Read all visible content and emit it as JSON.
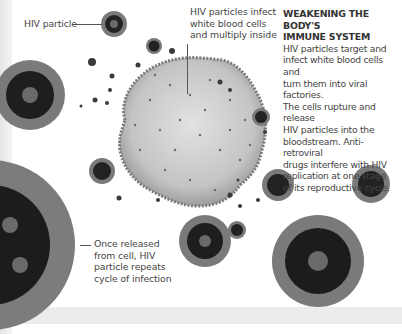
{
  "labels": {
    "hiv_particle": "HIV particle",
    "infect_line1": "HIV particles infect",
    "infect_line2": "white blood cells",
    "infect_line3": "and multiply inside",
    "released_line1": "Once released",
    "released_line2": "from cell, HIV",
    "released_line3": "particle repeats",
    "released_line4": "cycle of infection"
  },
  "sidebar": {
    "heading_line1": "WEAKENING THE BODY'S",
    "heading_line2": "IMMUNE SYSTEM",
    "body_lines": [
      "HIV particles target and",
      "infect white blood cells and",
      "turn them into viral factories.",
      "The cells rupture and release",
      "HIV particles into the",
      "bloodstream. Anti-retroviral",
      "drugs interfere with HIV",
      "replication at one stage",
      "of its reproductive cycle."
    ]
  },
  "illustration": {
    "subject": "HIV virus particles and infected white blood cell",
    "palette": {
      "virus_core": "#1e1e1e",
      "virus_spikes": "#7a7a7a",
      "cell_body": "#cfcfcf",
      "cell_edge": "#8a8a8a",
      "band": "#ececec"
    }
  }
}
